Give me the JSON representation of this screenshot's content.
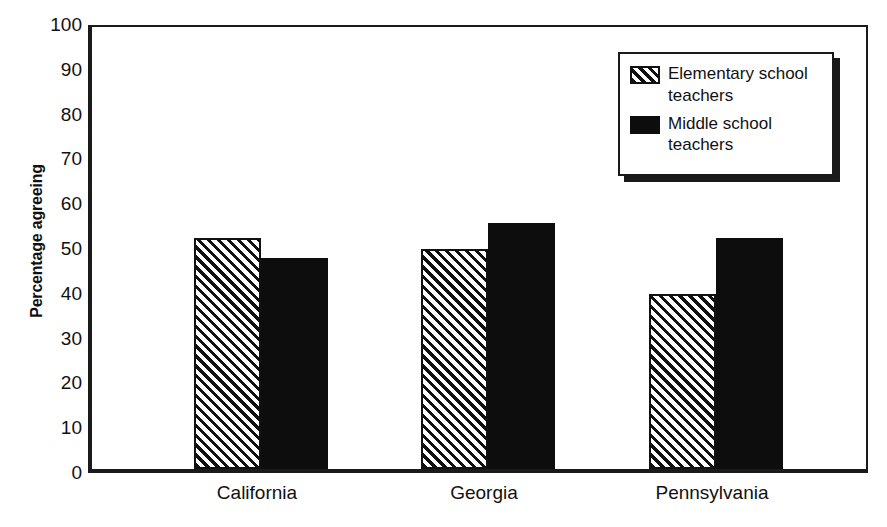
{
  "chart_data": {
    "type": "bar",
    "title": "",
    "xlabel": "",
    "ylabel": "Percentage agreeing",
    "ylim": [
      0,
      100
    ],
    "ytick_labels": [
      "0",
      "10",
      "20",
      "30",
      "40",
      "50",
      "60",
      "70",
      "80",
      "90",
      "100"
    ],
    "yticks": [
      0,
      10,
      20,
      30,
      40,
      50,
      60,
      70,
      80,
      90,
      100
    ],
    "grid": false,
    "legend_position": "top-right",
    "categories": [
      "California",
      "Georgia",
      "Pennsylvania"
    ],
    "series": [
      {
        "name": "Elementary school teachers",
        "pattern": "diagonal-hatch",
        "color": "#111111",
        "values": [
          51.5,
          49,
          39
        ]
      },
      {
        "name": "Middle school teachers",
        "pattern": "solid",
        "color": "#0d0d0d",
        "values": [
          47,
          55,
          51.5
        ]
      }
    ]
  },
  "legend": {
    "entries": [
      {
        "label": "Elementary school teachers",
        "swatch": "hatch-swatch-icon"
      },
      {
        "label": "Middle school teachers",
        "swatch": "solid-swatch-icon"
      }
    ]
  }
}
